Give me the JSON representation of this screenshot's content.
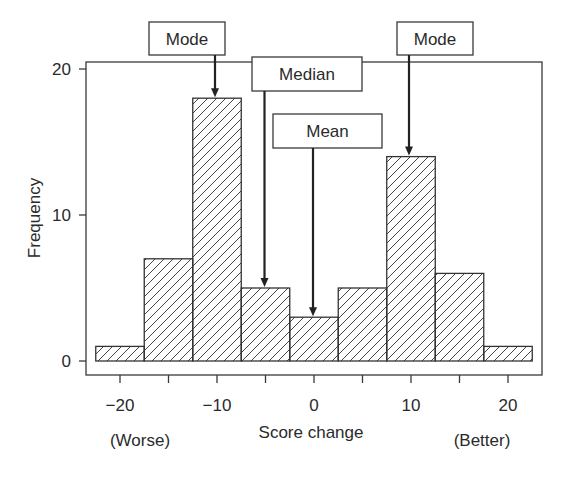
{
  "chart_data": {
    "type": "bar",
    "subtype": "histogram",
    "title": "",
    "xlabel": "Score change",
    "ylabel": "Frequency",
    "x_endpoint_labels": {
      "left": "(Worse)",
      "right": "(Better)"
    },
    "bin_width": 5,
    "categories": [
      -20,
      -15,
      -10,
      -5,
      0,
      5,
      10,
      15,
      20
    ],
    "values": [
      1,
      7,
      18,
      5,
      3,
      5,
      14,
      6,
      1
    ],
    "xlim": [
      -23.5,
      23.5
    ],
    "ylim": [
      0,
      20.5
    ],
    "x_ticks": [
      -20,
      -15,
      -10,
      -5,
      0,
      5,
      10,
      15,
      20
    ],
    "x_tick_labels": [
      "−20",
      "",
      "−10",
      "",
      "0",
      "",
      "10",
      "",
      "20"
    ],
    "y_ticks": [
      0,
      10,
      20
    ],
    "y_tick_labels": [
      "0",
      "10",
      "20"
    ],
    "grid": false,
    "fill_pattern": "diagonal-hatch",
    "annotations": [
      {
        "label": "Mode",
        "x": -10,
        "target_y": 18
      },
      {
        "label": "Median",
        "x": -5,
        "target_y": 5
      },
      {
        "label": "Mean",
        "x": 0,
        "target_y": 3
      },
      {
        "label": "Mode",
        "x": 10,
        "target_y": 14
      }
    ]
  },
  "colors": {
    "line": "#3a3a3a",
    "hatch": "#444444",
    "background": "#ffffff"
  }
}
